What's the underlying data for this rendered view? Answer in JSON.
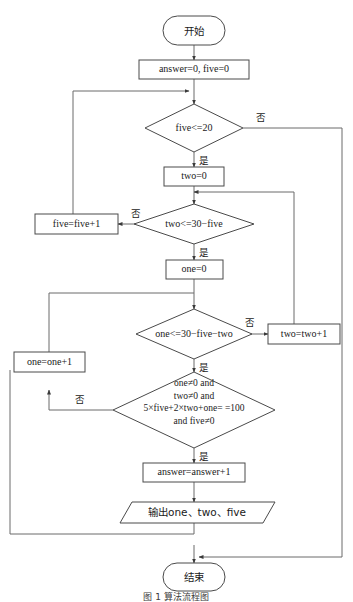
{
  "diagram": {
    "title_caption": "图 1  算法流程图",
    "nodes": {
      "start": "开始",
      "init": "answer=0, five=0",
      "cond_five": "five<=20",
      "two_init": "two=0",
      "five_inc": "five=five+1",
      "cond_two": "two<=30−five",
      "one_init": "one=0",
      "cond_one": "one<=30−five−two",
      "two_inc": "two=two+1",
      "one_inc": "one=one+1",
      "cond_check_l1": "one≠0 and",
      "cond_check_l2": "two≠0 and",
      "cond_check_l3": "5×five+2×two+one= =100",
      "cond_check_l4": "and five≠0",
      "answer_inc": "answer=answer+1",
      "output": "输出one、two、five",
      "end": "结束"
    },
    "branch_labels": {
      "yes": "是",
      "no": "否"
    },
    "labels": {
      "five_no": "否",
      "five_yes": "是",
      "two_no": "否",
      "two_yes": "是",
      "one_no": "否",
      "one_yes": "是",
      "check_no": "否",
      "check_yes": "是"
    },
    "colors": {
      "stroke": "#4a4a4a",
      "connector": "#6b6b6b",
      "text": "#1a1a1a",
      "background": "#ffffff"
    }
  }
}
